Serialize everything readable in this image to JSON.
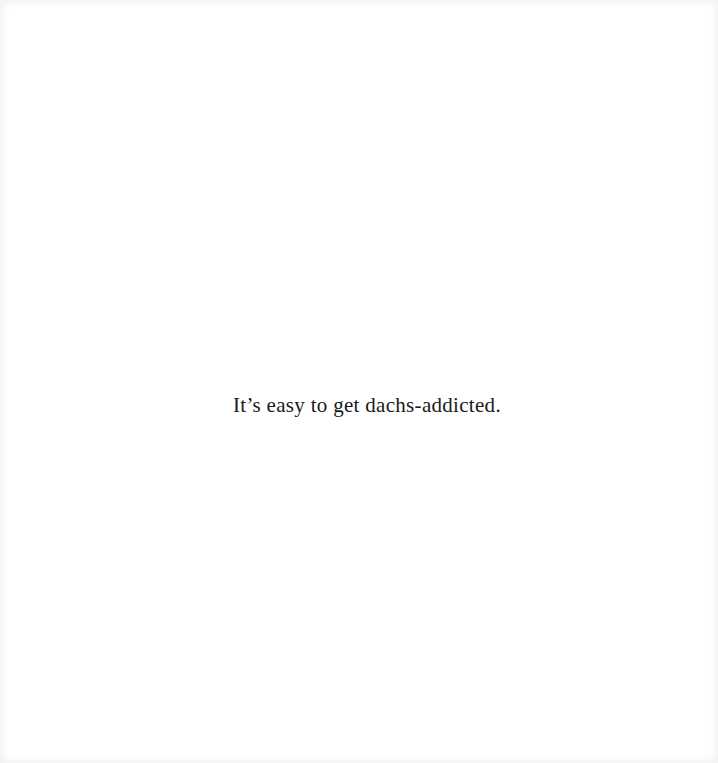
{
  "page": {
    "caption": "It’s easy to get dachs-addicted."
  },
  "colors": {
    "background": "#ffffff",
    "text": "#1a1a1a"
  }
}
